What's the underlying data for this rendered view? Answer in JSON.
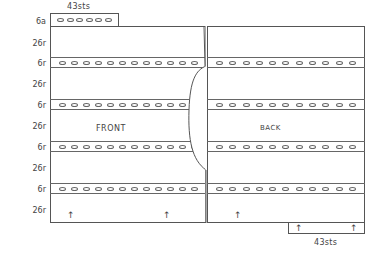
{
  "diagram": {
    "top_tab": {
      "label": "43sts",
      "ovals": 6
    },
    "bottom_tab": {
      "label": "43sts"
    },
    "row_labels": [
      {
        "text": "6a",
        "y": 17
      },
      {
        "text": "26r",
        "y": 39
      },
      {
        "text": "6r",
        "y": 59
      },
      {
        "text": "26r",
        "y": 80
      },
      {
        "text": "6r",
        "y": 101
      },
      {
        "text": "26r",
        "y": 122
      },
      {
        "text": "6r",
        "y": 143
      },
      {
        "text": "26r",
        "y": 164
      },
      {
        "text": "6r",
        "y": 185
      },
      {
        "text": "26r",
        "y": 206
      }
    ],
    "front": {
      "label": "FRONT",
      "ovals_per_band": 12
    },
    "back": {
      "label": "BACK",
      "ovals_per_band": 11
    },
    "bands_y": [
      57,
      99,
      141,
      183
    ],
    "arrow_glyph": "↑",
    "line_color": "#555555"
  }
}
